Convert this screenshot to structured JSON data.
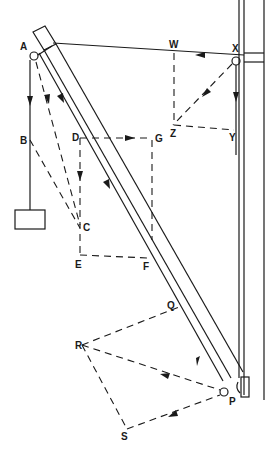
{
  "diagram": {
    "points": {
      "A": "A",
      "B": "B",
      "C": "C",
      "D": "D",
      "E": "E",
      "F": "F",
      "G": "G",
      "P": "P",
      "Q": "Q",
      "R": "R",
      "S": "S",
      "W": "W",
      "X": "X",
      "Y": "Y",
      "Z": "Z"
    },
    "components": [
      "wall",
      "boom",
      "tie-cable",
      "hanging-load",
      "pivot-A",
      "pivot-X",
      "hinge-P"
    ],
    "colors": {
      "ink": "#1a1a1a",
      "background": "#ffffff"
    }
  }
}
